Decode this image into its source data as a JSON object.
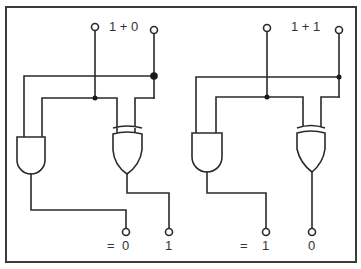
{
  "diagram": {
    "type": "half-adder-logic-circuits",
    "circuits": [
      {
        "id": "left",
        "title": "1 + 0",
        "inputs": [
          "1",
          "0"
        ],
        "gates": [
          "AND",
          "XOR"
        ],
        "outputs": {
          "equals": "=",
          "carry": "0",
          "sum": "1"
        }
      },
      {
        "id": "right",
        "title": "1 + 1",
        "inputs": [
          "1",
          "1"
        ],
        "gates": [
          "AND",
          "XOR"
        ],
        "outputs": {
          "equals": "=",
          "carry": "1",
          "sum": "0"
        }
      }
    ],
    "colors": {
      "line": "#2a2a2a",
      "frame": "#3a3a3a",
      "background": "#ffffff"
    }
  }
}
